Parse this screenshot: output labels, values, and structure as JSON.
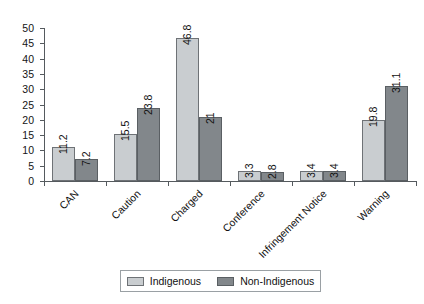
{
  "chart_data": {
    "type": "bar",
    "title": "",
    "subtitle": "",
    "xlabel": "",
    "ylabel": "",
    "ylim": [
      0,
      50
    ],
    "ytick_step": 5,
    "yticks": [
      0,
      5,
      10,
      15,
      20,
      25,
      30,
      35,
      40,
      45,
      50
    ],
    "grid": false,
    "legend_position": "bottom",
    "categories": [
      "CAN",
      "Caution",
      "Charged",
      "Conference",
      "Infringement Notice",
      "Warning"
    ],
    "series": [
      {
        "name": "Indigenous",
        "color": "#c9cdd0",
        "values": [
          11.2,
          15.5,
          46.8,
          3.3,
          3.4,
          19.8
        ],
        "labels": [
          "11.2",
          "15.5",
          "46.8",
          "3.3",
          "3.4",
          "19.8"
        ]
      },
      {
        "name": "Non-Indigenous",
        "color": "#82878b",
        "values": [
          7.2,
          23.8,
          21,
          2.8,
          3.4,
          31.1
        ],
        "labels": [
          "7.2",
          "23.8",
          "21",
          "2.8",
          "3.4",
          "31.1"
        ]
      }
    ]
  },
  "legend": {
    "entries": [
      {
        "label": "Indigenous"
      },
      {
        "label": "Non-Indigenous"
      }
    ]
  }
}
